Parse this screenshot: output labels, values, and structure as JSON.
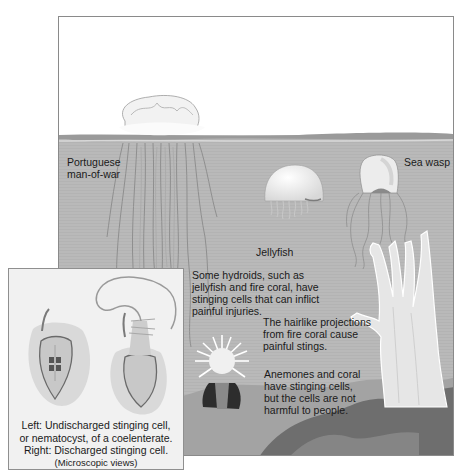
{
  "figure": {
    "labels": {
      "man_of_war": [
        "Portuguese",
        "man-of-war"
      ],
      "jellyfish": "Jellyfish",
      "sea_wasp": "Sea wasp",
      "hydroids": [
        "Some hydroids, such as",
        "jellyfish and fire coral, have",
        "stinging cells that can inflict",
        "painful injuries."
      ],
      "fire_coral": [
        "The hairlike projections",
        "from fire coral cause",
        "painful stings."
      ],
      "anemones": [
        "Anemones and coral",
        "have stinging cells,",
        "but the cells are not",
        "harmful to people."
      ]
    },
    "inset": {
      "caption": [
        "Left: Undischarged stinging cell,",
        "or nematocyst, of a coelenterate.",
        "Right: Discharged stinging cell."
      ],
      "note": "(Microscopic views)"
    },
    "colors": {
      "water": "#b9b9b9",
      "sky": "#ffffff",
      "seabed_dark": "#6e6e6e",
      "seabed_mid": "#a3a3a3",
      "animal_white": "#f4f4f4",
      "frame_border": "#8a8a8a",
      "inset_bg": "#f1f1f1"
    }
  }
}
